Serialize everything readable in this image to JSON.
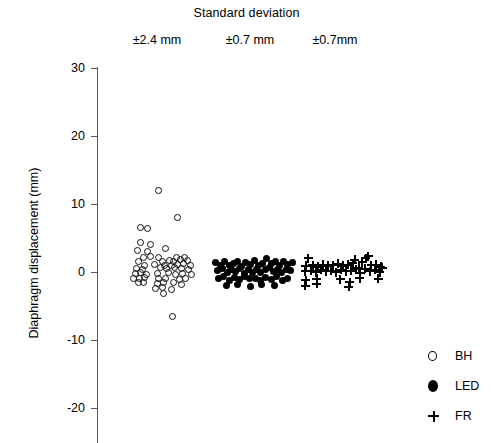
{
  "chart_data": {
    "type": "scatter",
    "title": "Standard deviation",
    "xlabel": "",
    "ylabel": "Diaphragm displacement (mm)",
    "ylim": [
      -25,
      30
    ],
    "yticks": [
      30,
      20,
      10,
      0,
      -10,
      -20
    ],
    "ytick_labels": [
      "30",
      "20",
      "10",
      "0",
      "-10",
      "-20"
    ],
    "grid": false,
    "legend_position": "bottom-right",
    "group_headers": [
      "±2.4 mm",
      "±0.7 mm",
      "±0.7mm"
    ],
    "series": [
      {
        "name": "BH",
        "marker": "open-circle",
        "sd_label": "±2.4 mm",
        "points": [
          [
            0.02,
            12.0
          ],
          [
            0.38,
            8.0
          ],
          [
            -0.3,
            6.6
          ],
          [
            -0.17,
            6.4
          ],
          [
            -0.3,
            4.4
          ],
          [
            -0.12,
            4.0
          ],
          [
            -0.36,
            3.2
          ],
          [
            -0.18,
            3.0
          ],
          [
            0.15,
            3.4
          ],
          [
            -0.24,
            2.2
          ],
          [
            -0.12,
            2.3
          ],
          [
            0.02,
            2.1
          ],
          [
            0.36,
            2.2
          ],
          [
            0.5,
            2.2
          ],
          [
            -0.34,
            1.5
          ],
          [
            0.1,
            1.6
          ],
          [
            0.22,
            1.7
          ],
          [
            0.3,
            1.6
          ],
          [
            0.42,
            1.8
          ],
          [
            0.56,
            1.7
          ],
          [
            -0.22,
            1.0
          ],
          [
            -0.05,
            1.1
          ],
          [
            0.14,
            0.9
          ],
          [
            0.26,
            1.0
          ],
          [
            0.38,
            1.1
          ],
          [
            0.48,
            1.2
          ],
          [
            0.6,
            1.0
          ],
          [
            -0.38,
            0.5
          ],
          [
            -0.26,
            0.4
          ],
          [
            0.06,
            0.6
          ],
          [
            0.18,
            0.5
          ],
          [
            0.32,
            0.7
          ],
          [
            0.44,
            0.5
          ],
          [
            0.58,
            0.4
          ],
          [
            -0.4,
            -0.2
          ],
          [
            -0.3,
            -0.1
          ],
          [
            -0.2,
            -0.3
          ],
          [
            0.0,
            -0.2
          ],
          [
            0.2,
            -0.1
          ],
          [
            0.34,
            -0.3
          ],
          [
            0.46,
            -0.2
          ],
          [
            0.62,
            -0.4
          ],
          [
            -0.42,
            -0.9
          ],
          [
            -0.32,
            -1.0
          ],
          [
            -0.22,
            -0.8
          ],
          [
            0.02,
            -1.0
          ],
          [
            0.16,
            -0.9
          ],
          [
            0.4,
            -1.1
          ],
          [
            0.52,
            -1.0
          ],
          [
            -0.34,
            -1.6
          ],
          [
            -0.24,
            -1.5
          ],
          [
            0.0,
            -1.7
          ],
          [
            0.12,
            -1.6
          ],
          [
            0.3,
            -1.5
          ],
          [
            0.44,
            -1.8
          ],
          [
            -0.02,
            -2.4
          ],
          [
            0.1,
            -2.3
          ],
          [
            0.26,
            -2.5
          ],
          [
            0.12,
            -3.2
          ],
          [
            0.28,
            -6.5
          ]
        ]
      },
      {
        "name": "LED",
        "marker": "filled-circle",
        "sd_label": "±0.7 mm",
        "points": [
          [
            -0.82,
            1.4
          ],
          [
            -0.7,
            1.0
          ],
          [
            -0.6,
            1.5
          ],
          [
            -0.5,
            0.9
          ],
          [
            -0.4,
            1.3
          ],
          [
            -0.3,
            1.6
          ],
          [
            -0.2,
            0.8
          ],
          [
            -0.1,
            1.4
          ],
          [
            0.0,
            1.1
          ],
          [
            0.1,
            1.7
          ],
          [
            0.2,
            0.9
          ],
          [
            0.3,
            1.3
          ],
          [
            0.4,
            2.0
          ],
          [
            0.5,
            1.2
          ],
          [
            0.6,
            1.5
          ],
          [
            0.7,
            0.9
          ],
          [
            0.8,
            1.6
          ],
          [
            0.9,
            1.1
          ],
          [
            1.0,
            1.4
          ],
          [
            -0.78,
            0.2
          ],
          [
            -0.66,
            0.5
          ],
          [
            -0.54,
            -0.1
          ],
          [
            -0.44,
            0.4
          ],
          [
            -0.34,
            0.1
          ],
          [
            -0.24,
            0.5
          ],
          [
            -0.14,
            -0.2
          ],
          [
            -0.04,
            0.3
          ],
          [
            0.06,
            0.0
          ],
          [
            0.16,
            0.4
          ],
          [
            0.26,
            -0.1
          ],
          [
            0.36,
            0.3
          ],
          [
            0.46,
            0.6
          ],
          [
            0.56,
            0.1
          ],
          [
            0.66,
            0.4
          ],
          [
            0.76,
            -0.1
          ],
          [
            0.86,
            0.3
          ],
          [
            0.96,
            0.2
          ],
          [
            -0.74,
            -1.0
          ],
          [
            -0.62,
            -0.7
          ],
          [
            -0.5,
            -1.2
          ],
          [
            -0.38,
            -0.8
          ],
          [
            -0.26,
            -1.1
          ],
          [
            -0.14,
            -0.6
          ],
          [
            -0.02,
            -1.0
          ],
          [
            0.12,
            -0.9
          ],
          [
            0.24,
            -1.3
          ],
          [
            0.38,
            -0.8
          ],
          [
            0.52,
            -1.1
          ],
          [
            0.64,
            -0.7
          ],
          [
            0.78,
            -1.2
          ],
          [
            0.9,
            -0.9
          ],
          [
            -0.56,
            -2.0
          ],
          [
            -0.3,
            -1.9
          ],
          [
            0.0,
            -2.1
          ],
          [
            0.28,
            -1.8
          ],
          [
            0.58,
            -2.0
          ]
        ]
      },
      {
        "name": "FR",
        "marker": "plus",
        "sd_label": "±0.7mm",
        "points": [
          [
            -0.8,
            2.0
          ],
          [
            -0.86,
            0.9
          ],
          [
            -0.7,
            1.0
          ],
          [
            -0.58,
            0.8
          ],
          [
            -0.46,
            1.1
          ],
          [
            -0.34,
            0.9
          ],
          [
            -0.22,
            1.0
          ],
          [
            -0.1,
            1.2
          ],
          [
            0.02,
            0.9
          ],
          [
            0.14,
            1.1
          ],
          [
            0.26,
            1.3
          ],
          [
            0.3,
            1.8
          ],
          [
            0.4,
            0.6
          ],
          [
            0.48,
            1.4
          ],
          [
            0.56,
            2.0
          ],
          [
            0.62,
            2.3
          ],
          [
            0.7,
            1.0
          ],
          [
            0.82,
            1.1
          ],
          [
            0.92,
            0.8
          ],
          [
            -0.88,
            0.1
          ],
          [
            -0.74,
            0.2
          ],
          [
            -0.62,
            0.0
          ],
          [
            -0.5,
            0.3
          ],
          [
            -0.38,
            0.1
          ],
          [
            -0.26,
            0.2
          ],
          [
            -0.14,
            0.0
          ],
          [
            -0.02,
            0.3
          ],
          [
            0.1,
            0.1
          ],
          [
            0.22,
            0.2
          ],
          [
            0.34,
            0.4
          ],
          [
            0.44,
            -0.2
          ],
          [
            0.54,
            0.5
          ],
          [
            0.66,
            0.1
          ],
          [
            0.78,
            0.3
          ],
          [
            0.9,
            0.0
          ],
          [
            0.96,
            0.6
          ],
          [
            -0.86,
            -1.2
          ],
          [
            -0.6,
            -1.0
          ],
          [
            -0.6,
            -1.7
          ],
          [
            -0.04,
            -1.1
          ],
          [
            0.18,
            -1.5
          ],
          [
            0.42,
            -0.9
          ],
          [
            0.86,
            -1.0
          ],
          [
            -0.88,
            -2.0
          ],
          [
            0.16,
            -2.2
          ]
        ]
      }
    ]
  },
  "legend": {
    "items": [
      {
        "label": "BH",
        "marker": "open-circle"
      },
      {
        "label": "LED",
        "marker": "filled-circle"
      },
      {
        "label": "FR",
        "marker": "plus"
      }
    ]
  }
}
